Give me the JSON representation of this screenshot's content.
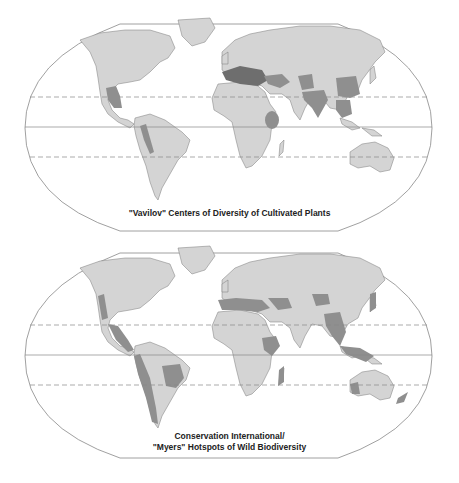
{
  "colors": {
    "land": "#d4d4d4",
    "hotspot": "#8f8f8f",
    "hotspot_dark": "#6e6e6e",
    "outline": "#7a7a7a",
    "frame": "#888888",
    "background": "#ffffff"
  },
  "maps": [
    {
      "id": "vavilov",
      "caption": "\"Vavilov\" Centers of Diversity of Cultivated Plants",
      "highlighted_regions": [
        "Mexico / Central America",
        "Andes",
        "Mediterranean",
        "Near East / Caucasus",
        "Ethiopia",
        "Central Asia",
        "India",
        "China",
        "Southeast Asia"
      ]
    },
    {
      "id": "myers",
      "caption_line1": "Conservation International/",
      "caption_line2": "\"Myers\" Hotspots of Wild Biodiversity",
      "highlighted_regions": [
        "California",
        "Mesoamerica",
        "Caribbean",
        "Tropical Andes",
        "Chilean forests",
        "Atlantic Forest / Cerrado",
        "Mediterranean Basin",
        "Caucasus",
        "Mountains of Central Asia",
        "Eastern Arc / Horn of Africa",
        "Madagascar",
        "Himalaya / Indo-Burma",
        "Japan",
        "Sundaland / Philippines",
        "Southwest Australia",
        "New Zealand"
      ]
    }
  ],
  "grid": {
    "tropic_lines": "dashed",
    "equator": "solid"
  }
}
